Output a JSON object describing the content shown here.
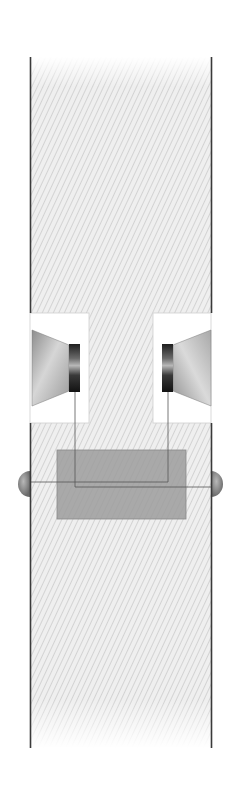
{
  "diagram": {
    "colors": {
      "background": "#ffffff",
      "wall": "#3a3a3a",
      "hatch_fill": "#e9e9e9",
      "hatch_line": "#d2d2d2",
      "cutout": "#ffffff",
      "cutout_border": "#c8c8c8",
      "cone_light": "#d9d9d9",
      "cone_dark": "#8a8a8a",
      "magnet_dark": "#1e1e1e",
      "magnet_light": "#9a9a9a",
      "amplifier_box": "#9e9e9e",
      "wire": "#555555",
      "terminal": "#7a7a7a"
    },
    "components": [
      {
        "id": "enclosure",
        "label": "Enclosure walls"
      },
      {
        "id": "speaker-left",
        "label": "Left speaker driver"
      },
      {
        "id": "speaker-right",
        "label": "Right speaker driver"
      },
      {
        "id": "amplifier",
        "label": "Amplifier box"
      },
      {
        "id": "terminal-left",
        "label": "Left terminal"
      },
      {
        "id": "terminal-right",
        "label": "Right terminal"
      }
    ]
  }
}
